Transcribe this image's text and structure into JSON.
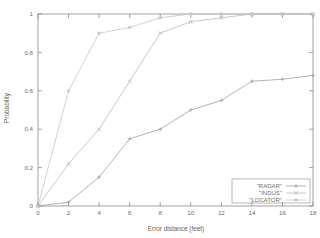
{
  "chart_data": {
    "type": "line",
    "title": "",
    "xlabel": "Error distance (feet)",
    "ylabel": "Probability",
    "xlim": [
      0,
      18
    ],
    "ylim": [
      0,
      1
    ],
    "xticks": [
      0,
      2,
      4,
      6,
      8,
      10,
      12,
      14,
      16,
      18
    ],
    "xtick_labels": [
      "0",
      "2",
      "4",
      "6",
      "8",
      "10",
      "12",
      "14",
      "16",
      "18"
    ],
    "yticks": [
      0,
      0.2,
      0.4,
      0.6,
      0.8,
      1
    ],
    "ytick_labels": [
      "0",
      "0.2",
      "0.4",
      "0.6",
      "0.8",
      "1"
    ],
    "grid": false,
    "legend_position": "bottom-right",
    "x": [
      0,
      2,
      4,
      6,
      8,
      10,
      12,
      14,
      16,
      18
    ],
    "series": [
      {
        "name": "\"RADAR\"",
        "marker": "plus",
        "color": "#9a9a9a",
        "values": [
          0.0,
          0.02,
          0.15,
          0.35,
          0.4,
          0.5,
          0.55,
          0.65,
          0.66,
          0.68
        ]
      },
      {
        "name": "\"INDUS\"",
        "marker": "cross",
        "color": "#b5b5b5",
        "values": [
          0.0,
          0.22,
          0.4,
          0.65,
          0.9,
          0.96,
          0.98,
          1.0,
          1.0,
          1.0
        ]
      },
      {
        "name": "\"LOCATOR\"",
        "marker": "star",
        "color": "#c2c2c2",
        "values": [
          0.0,
          0.6,
          0.9,
          0.93,
          0.98,
          1.0,
          1.0,
          1.0,
          1.0,
          1.0
        ]
      }
    ]
  },
  "axes": {
    "xlabel": "Error distance (feet)",
    "ylabel": "Probability"
  },
  "legend": {
    "entries": [
      {
        "label": "\"RADAR\""
      },
      {
        "label": "\"INDUS\""
      },
      {
        "label": "\"LOCATOR\""
      }
    ]
  }
}
